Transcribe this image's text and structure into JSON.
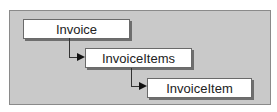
{
  "diagram": {
    "nodes": [
      {
        "id": "invoice",
        "label": "Invoice"
      },
      {
        "id": "invoice-items",
        "label": "InvoiceItems"
      },
      {
        "id": "invoice-item",
        "label": "InvoiceItem"
      }
    ],
    "edges": [
      {
        "from": "invoice",
        "to": "invoice-items"
      },
      {
        "from": "invoice-items",
        "to": "invoice-item"
      }
    ],
    "colors": {
      "panel": "#c9c9c9",
      "node": "#ffffff",
      "connector": "#333333"
    }
  }
}
